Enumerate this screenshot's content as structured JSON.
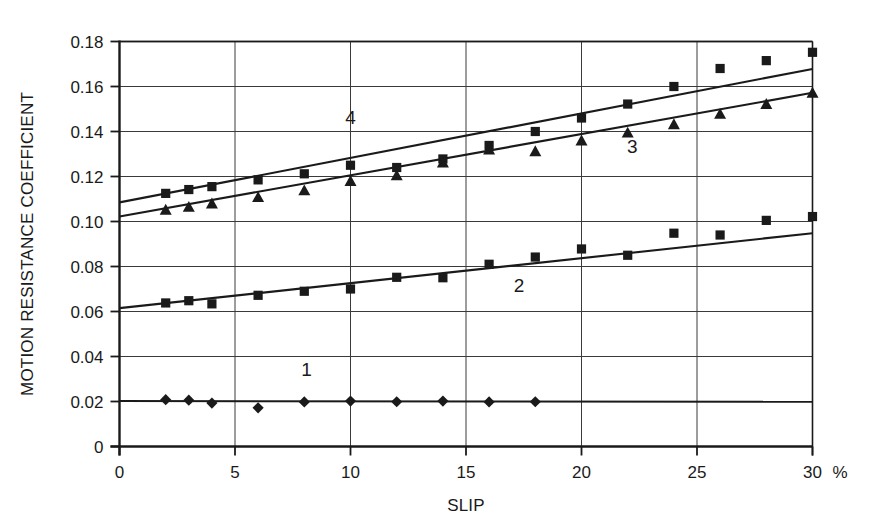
{
  "chart_data": {
    "type": "scatter",
    "title": "",
    "subtitle": "",
    "xlabel": "SLIP",
    "ylabel": "MOTION RESISTANCE COEFFICIENT",
    "x_unit_label": "%",
    "xlim": [
      0,
      30
    ],
    "ylim": [
      0,
      0.18
    ],
    "grid": true,
    "legend_position": "inline-annotations",
    "xticks": [
      0,
      5,
      10,
      15,
      20,
      25,
      30
    ],
    "xtick_labels": [
      "0",
      "5",
      "10",
      "15",
      "20",
      "25",
      "30"
    ],
    "yticks": [
      0,
      0.02,
      0.04,
      0.06,
      0.08,
      0.1,
      0.12,
      0.14,
      0.16,
      0.18
    ],
    "ytick_labels": [
      "0",
      "0.02",
      "0.04",
      "0.06",
      "0.08",
      "0.10",
      "0.12",
      "0.14",
      "0.16",
      "0.18"
    ],
    "annotations": [
      {
        "text": "1",
        "x": 8.1,
        "y": 0.0315
      },
      {
        "text": "2",
        "x": 17.3,
        "y": 0.0685
      },
      {
        "text": "3",
        "x": 22.2,
        "y": 0.1305
      },
      {
        "text": "4",
        "x": 10.0,
        "y": 0.1435
      }
    ],
    "series": [
      {
        "name": "1",
        "marker": "diamond",
        "color": "#1a1a1a",
        "has_trendline": true,
        "trendline": {
          "x": [
            0,
            30
          ],
          "y": [
            0.0202,
            0.0199
          ]
        },
        "points": [
          {
            "x": 2,
            "y": 0.0208
          },
          {
            "x": 3,
            "y": 0.0206
          },
          {
            "x": 4,
            "y": 0.0193
          },
          {
            "x": 6,
            "y": 0.0172
          },
          {
            "x": 8,
            "y": 0.0198
          },
          {
            "x": 10,
            "y": 0.0202
          },
          {
            "x": 12,
            "y": 0.0199
          },
          {
            "x": 14,
            "y": 0.0202
          },
          {
            "x": 16,
            "y": 0.0198
          },
          {
            "x": 18,
            "y": 0.0199
          }
        ]
      },
      {
        "name": "2",
        "marker": "square",
        "color": "#1a1a1a",
        "has_trendline": true,
        "trendline": {
          "x": [
            0,
            30
          ],
          "y": [
            0.0615,
            0.0948
          ]
        },
        "points": [
          {
            "x": 2,
            "y": 0.0638
          },
          {
            "x": 3,
            "y": 0.0648
          },
          {
            "x": 4,
            "y": 0.0634
          },
          {
            "x": 6,
            "y": 0.0672
          },
          {
            "x": 8,
            "y": 0.069
          },
          {
            "x": 10,
            "y": 0.07
          },
          {
            "x": 12,
            "y": 0.0752
          },
          {
            "x": 14,
            "y": 0.075
          },
          {
            "x": 16,
            "y": 0.081
          },
          {
            "x": 18,
            "y": 0.0842
          },
          {
            "x": 20,
            "y": 0.0878
          },
          {
            "x": 22,
            "y": 0.085
          },
          {
            "x": 24,
            "y": 0.0948
          },
          {
            "x": 26,
            "y": 0.094
          },
          {
            "x": 28,
            "y": 0.1005
          },
          {
            "x": 30,
            "y": 0.1022
          }
        ]
      },
      {
        "name": "3",
        "marker": "triangle",
        "color": "#1a1a1a",
        "has_trendline": true,
        "trendline": {
          "x": [
            0,
            30
          ],
          "y": [
            0.1022,
            0.1572
          ]
        },
        "points": [
          {
            "x": 2,
            "y": 0.1052
          },
          {
            "x": 3,
            "y": 0.1065
          },
          {
            "x": 4,
            "y": 0.108
          },
          {
            "x": 6,
            "y": 0.1108
          },
          {
            "x": 8,
            "y": 0.1138
          },
          {
            "x": 10,
            "y": 0.118
          },
          {
            "x": 12,
            "y": 0.1205
          },
          {
            "x": 14,
            "y": 0.1262
          },
          {
            "x": 16,
            "y": 0.132
          },
          {
            "x": 18,
            "y": 0.1312
          },
          {
            "x": 20,
            "y": 0.136
          },
          {
            "x": 22,
            "y": 0.1395
          },
          {
            "x": 24,
            "y": 0.1432
          },
          {
            "x": 26,
            "y": 0.1478
          },
          {
            "x": 28,
            "y": 0.1522
          },
          {
            "x": 30,
            "y": 0.1572
          }
        ]
      },
      {
        "name": "4",
        "marker": "square",
        "color": "#1a1a1a",
        "has_trendline": true,
        "trendline": {
          "x": [
            0,
            30
          ],
          "y": [
            0.1085,
            0.1678
          ]
        },
        "points": [
          {
            "x": 2,
            "y": 0.1125
          },
          {
            "x": 3,
            "y": 0.1142
          },
          {
            "x": 4,
            "y": 0.1155
          },
          {
            "x": 6,
            "y": 0.1185
          },
          {
            "x": 8,
            "y": 0.1212
          },
          {
            "x": 10,
            "y": 0.125
          },
          {
            "x": 12,
            "y": 0.124
          },
          {
            "x": 14,
            "y": 0.1278
          },
          {
            "x": 16,
            "y": 0.1338
          },
          {
            "x": 18,
            "y": 0.14
          },
          {
            "x": 20,
            "y": 0.146
          },
          {
            "x": 22,
            "y": 0.1522
          },
          {
            "x": 24,
            "y": 0.16
          },
          {
            "x": 26,
            "y": 0.168
          },
          {
            "x": 28,
            "y": 0.1715
          },
          {
            "x": 30,
            "y": 0.1752
          }
        ]
      }
    ]
  }
}
